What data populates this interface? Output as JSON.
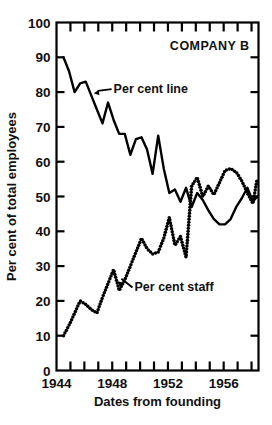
{
  "chart_data": {
    "type": "line",
    "title": "COMPANY B",
    "xlabel": "Dates from founding",
    "ylabel": "Per cent of total employees",
    "xlim": [
      1944,
      1958.5
    ],
    "ylim": [
      0,
      100
    ],
    "ytick_values": [
      0,
      10,
      20,
      30,
      40,
      50,
      60,
      70,
      80,
      90,
      100
    ],
    "ytick_labels": [
      "0",
      "10",
      "20",
      "30",
      "40",
      "50",
      "60",
      "70",
      "80",
      "90",
      "100"
    ],
    "xtick_values": [
      1944,
      1945,
      1946,
      1947,
      1948,
      1949,
      1950,
      1951,
      1952,
      1953,
      1954,
      1955,
      1956,
      1957,
      1958
    ],
    "xtick_labels_shown": [
      "1944",
      "1948",
      "1952",
      "1956"
    ],
    "xtick_labeled_values": [
      1944,
      1948,
      1952,
      1956
    ],
    "grid": false,
    "legend": "annotations-inline",
    "annotations": [
      {
        "text": "COMPANY B",
        "x": 1955.0,
        "y": 92
      },
      {
        "text": "Per cent line",
        "x": 1948.1,
        "y": 81,
        "points_to_x": 1946.6,
        "points_to_y": 79.5
      },
      {
        "text": "Per cent staff",
        "x": 1949.6,
        "y": 24,
        "points_to_x": 1948.3,
        "points_to_y": 25.5
      }
    ],
    "series": [
      {
        "name": "Per cent line",
        "style": "solid",
        "color": "#000000",
        "x": [
          1944.5,
          1944.9,
          1945.3,
          1945.7,
          1946.1,
          1946.5,
          1946.9,
          1947.3,
          1947.7,
          1948.1,
          1948.5,
          1948.9,
          1949.3,
          1949.7,
          1950.1,
          1950.5,
          1950.9,
          1951.3,
          1951.7,
          1952.1,
          1952.5,
          1952.9,
          1953.3,
          1953.7,
          1954.1,
          1954.5,
          1954.9,
          1955.3,
          1955.7,
          1956.1,
          1956.5,
          1956.9,
          1957.3,
          1957.7,
          1958.1,
          1958.4
        ],
        "values": [
          90,
          86,
          80,
          82.5,
          83,
          79,
          75,
          71,
          77,
          72,
          68,
          68,
          62,
          66.5,
          67,
          63.5,
          56.5,
          67.5,
          58,
          51,
          52,
          48.5,
          52.5,
          47,
          51,
          49,
          46,
          43.5,
          42,
          42,
          43.5,
          47,
          49.5,
          52.5,
          48.5,
          50
        ]
      },
      {
        "name": "Per cent staff",
        "style": "dotted",
        "color": "#000000",
        "x": [
          1944.5,
          1944.9,
          1945.3,
          1945.7,
          1946.1,
          1946.5,
          1946.9,
          1947.3,
          1947.7,
          1948.1,
          1948.5,
          1948.9,
          1949.3,
          1949.7,
          1950.1,
          1950.5,
          1950.9,
          1951.3,
          1951.7,
          1952.1,
          1952.5,
          1952.9,
          1953.3,
          1953.7,
          1954.1,
          1954.5,
          1954.9,
          1955.3,
          1955.7,
          1956.1,
          1956.5,
          1956.9,
          1957.3,
          1957.7,
          1958.1,
          1958.4
        ],
        "values": [
          10,
          13,
          16.5,
          20,
          19,
          17.5,
          16.5,
          21,
          25,
          29,
          23,
          26,
          30,
          34,
          38,
          35,
          33.5,
          34,
          38,
          44,
          36,
          38.5,
          32.5,
          53,
          55.5,
          50,
          53,
          50.5,
          54,
          57.5,
          58,
          57,
          54.5,
          51,
          48,
          55
        ]
      }
    ]
  },
  "caption": {
    "text": ""
  }
}
